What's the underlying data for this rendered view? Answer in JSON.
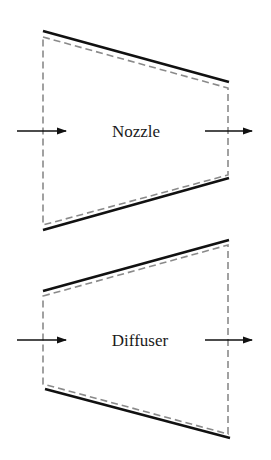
{
  "diagram": {
    "colors": {
      "wall": "#111111",
      "control_volume": "#8a8a8a",
      "arrow": "#111111",
      "text": "#1a1a1a",
      "background": "#ffffff"
    },
    "devices": [
      {
        "name": "nozzle",
        "label": "Nozzle",
        "wall_top": [
          [
            43,
            31
          ],
          [
            229,
            82
          ]
        ],
        "wall_bottom": [
          [
            43,
            230
          ],
          [
            229,
            178
          ]
        ],
        "control_volume": [
          [
            43,
            37
          ],
          [
            228,
            88
          ],
          [
            228,
            175
          ],
          [
            43,
            225
          ]
        ],
        "inlet_arrow": [
          [
            17,
            131
          ],
          [
            66,
            131
          ]
        ],
        "outlet_arrow": [
          [
            205,
            131
          ],
          [
            252,
            131
          ]
        ],
        "label_pos": [
          136,
          137
        ]
      },
      {
        "name": "diffuser",
        "label": "Diffuser",
        "wall_top": [
          [
            43,
            291
          ],
          [
            229,
            240
          ]
        ],
        "wall_bottom": [
          [
            45,
            389
          ],
          [
            230,
            438
          ]
        ],
        "control_volume": [
          [
            43,
            296
          ],
          [
            228,
            245
          ],
          [
            228,
            434
          ],
          [
            43,
            384
          ]
        ],
        "inlet_arrow": [
          [
            17,
            340
          ],
          [
            66,
            340
          ]
        ],
        "outlet_arrow": [
          [
            205,
            340
          ],
          [
            252,
            340
          ]
        ],
        "label_pos": [
          140,
          346
        ]
      }
    ]
  }
}
